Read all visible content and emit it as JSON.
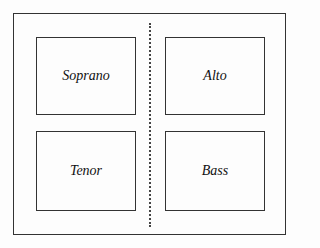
{
  "diagram": {
    "boxes": [
      {
        "label": "Soprano"
      },
      {
        "label": "Alto"
      },
      {
        "label": "Tenor"
      },
      {
        "label": "Bass"
      }
    ]
  }
}
